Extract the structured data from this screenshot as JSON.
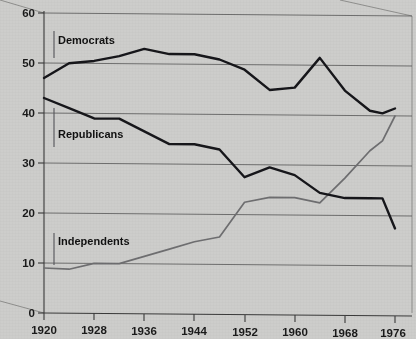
{
  "chart_data": {
    "type": "line",
    "title": "",
    "subtitle": "",
    "xlabel": "",
    "ylabel": "",
    "xlim": [
      1920,
      1976
    ],
    "ylim": [
      0,
      60
    ],
    "xticks": [
      1920,
      1928,
      1936,
      1944,
      1952,
      1960,
      1968,
      1976
    ],
    "yticks": [
      0,
      10,
      20,
      30,
      40,
      50,
      60
    ],
    "grid": "horizontal",
    "legend_position": "inline-labels",
    "series": [
      {
        "name": "Democrats",
        "color": "#16161a",
        "x": [
          1920,
          1924,
          1928,
          1932,
          1936,
          1940,
          1944,
          1948,
          1952,
          1956,
          1960,
          1964,
          1968,
          1972,
          1974,
          1976
        ],
        "values": [
          47,
          50,
          50.5,
          51.5,
          53,
          52,
          52,
          51,
          49,
          45,
          45.5,
          51.5,
          45,
          41,
          40.5,
          41.5
        ]
      },
      {
        "name": "Republicans",
        "color": "#16161a",
        "x": [
          1920,
          1924,
          1928,
          1932,
          1936,
          1940,
          1944,
          1948,
          1952,
          1956,
          1960,
          1964,
          1968,
          1972,
          1974,
          1976
        ],
        "values": [
          43,
          41,
          39,
          39,
          36.5,
          34,
          34,
          33,
          27.5,
          29.5,
          28,
          24.5,
          23.5,
          23.5,
          23.5,
          17.5
        ]
      },
      {
        "name": "Independents",
        "color": "#6e6e70",
        "x": [
          1920,
          1924,
          1928,
          1932,
          1936,
          1940,
          1944,
          1948,
          1952,
          1956,
          1960,
          1964,
          1968,
          1972,
          1974,
          1976
        ],
        "values": [
          9,
          8.8,
          10,
          10,
          11.5,
          13,
          14.5,
          15.5,
          22.5,
          23.5,
          23.5,
          22.5,
          27.5,
          33,
          35,
          40
        ]
      }
    ],
    "series_labels": [
      {
        "text": "Democrats",
        "x_px": 56,
        "y_px": 44
      },
      {
        "text": "Republicans",
        "x_px": 56,
        "y_px": 138
      },
      {
        "text": "Independents",
        "x_px": 56,
        "y_px": 245
      }
    ]
  },
  "axes": {
    "y_tick_labels": [
      "60",
      "50",
      "40",
      "30",
      "20",
      "10",
      "0"
    ],
    "x_tick_labels": [
      "1920",
      "1928",
      "1936",
      "1944",
      "1952",
      "1960",
      "1968",
      "1976"
    ]
  },
  "colors": {
    "background": "#cdcdcb",
    "series_dark": "#16161a",
    "series_gray": "#6e6e70",
    "gridline": "#555555",
    "text": "#1a1a1a"
  }
}
